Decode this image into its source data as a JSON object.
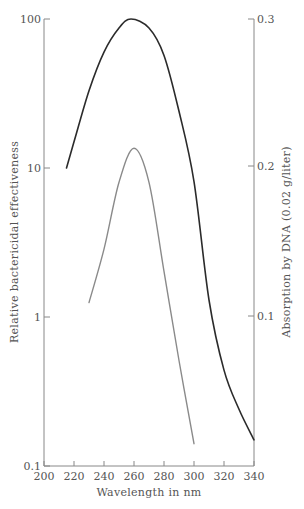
{
  "chart_data": {
    "type": "line",
    "title": "",
    "xlabel": "Wavelength in nm",
    "ylabel_left": "Relative bactericidal effectiveness",
    "ylabel_right": "Absorption by DNA (0.02 g/liter)",
    "xlim": [
      200,
      340
    ],
    "ylim_left": [
      0.1,
      100
    ],
    "yscale_left": "log",
    "ylim_right": [
      0.0,
      0.3
    ],
    "x_ticks": [
      "200",
      "220",
      "240",
      "260",
      "280",
      "300",
      "320",
      "340"
    ],
    "y_ticks_left": [
      "0.1",
      "1",
      "10",
      "100"
    ],
    "y_ticks_right": [
      "0.1",
      "0.2",
      "0.3"
    ],
    "grid": false,
    "legend": null,
    "series": [
      {
        "name": "Relative bactericidal effectiveness",
        "axis": "left",
        "color": "#2b2b2b",
        "x": [
          215,
          220,
          230,
          240,
          250,
          258,
          270,
          280,
          290,
          300,
          310,
          320,
          330,
          340
        ],
        "values": [
          10,
          15,
          33,
          60,
          87,
          100,
          87,
          57,
          24,
          8.1,
          1.3,
          0.44,
          0.24,
          0.15
        ]
      },
      {
        "name": "Absorption by DNA (0.02 g/liter)",
        "axis": "right",
        "color": "#8a8a8a",
        "x": [
          230,
          240,
          250,
          260,
          270,
          280,
          290,
          300
        ],
        "values": [
          0.109,
          0.145,
          0.19,
          0.213,
          0.19,
          0.13,
          0.07,
          0.014
        ]
      }
    ]
  }
}
